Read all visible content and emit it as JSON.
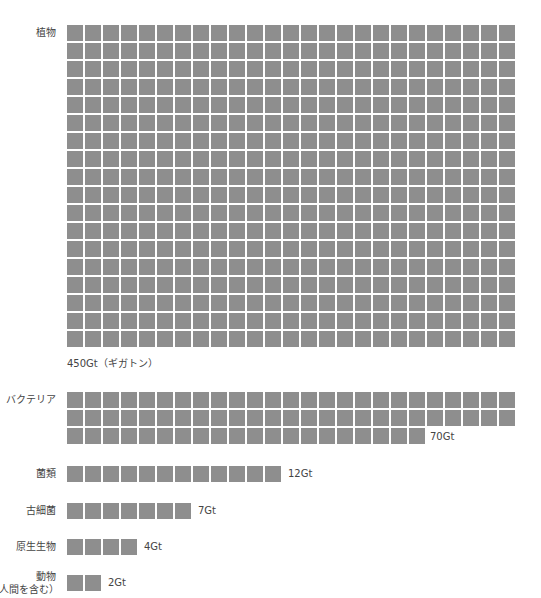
{
  "chart_data": {
    "type": "waffle",
    "title": "",
    "unit": "Gt",
    "unit_note": "1 square = 1Gt",
    "square_color": "#8e8e8e",
    "categories": [
      "植物",
      "バクテリア",
      "菌類",
      "古細菌",
      "原生生物",
      "動物（人間を含む）"
    ],
    "values": [
      450,
      70,
      12,
      7,
      4,
      2
    ],
    "grid_columns": 25
  },
  "rows": [
    {
      "label": "植物",
      "label2": "",
      "value_label": "450Gt（ギガトン）",
      "count": 450
    },
    {
      "label": "バクテリア",
      "label2": "",
      "value_label": "70Gt",
      "count": 70
    },
    {
      "label": "菌類",
      "label2": "",
      "value_label": "12Gt",
      "count": 12
    },
    {
      "label": "古細菌",
      "label2": "",
      "value_label": "7Gt",
      "count": 7
    },
    {
      "label": "原生生物",
      "label2": "",
      "value_label": "4Gt",
      "count": 4
    },
    {
      "label": "動物",
      "label2": "（人間を含む）",
      "value_label": "2Gt",
      "count": 2
    }
  ]
}
